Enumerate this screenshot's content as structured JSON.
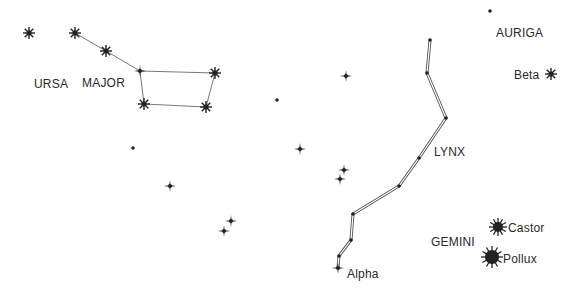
{
  "labels": {
    "ursa": "URSA",
    "major": "MAJOR",
    "auriga": "AURIGA",
    "beta": "Beta",
    "lynx": "LYNX",
    "gemini": "GEMINI",
    "castor": "Castor",
    "pollux": "Pollux",
    "alpha": "Alpha"
  },
  "colors": {
    "ink": "#222222",
    "line": "#555555",
    "background": "#ffffff"
  },
  "constellations": {
    "ursa_major": {
      "stars": [
        [
          29,
          33
        ],
        [
          75,
          33
        ],
        [
          106,
          51
        ],
        [
          140,
          71
        ],
        [
          215,
          73
        ],
        [
          206,
          107
        ],
        [
          144,
          104
        ]
      ],
      "lines": [
        [
          0,
          0
        ],
        [
          1,
          2
        ],
        [
          2,
          3
        ],
        [
          3,
          4
        ],
        [
          4,
          5
        ],
        [
          5,
          6
        ],
        [
          6,
          3
        ]
      ]
    },
    "lynx": {
      "path": [
        [
          430,
          40
        ],
        [
          427,
          73
        ],
        [
          446,
          118
        ],
        [
          419,
          158
        ],
        [
          399,
          186
        ],
        [
          353,
          214
        ],
        [
          351,
          240
        ],
        [
          339,
          256
        ],
        [
          338,
          268
        ]
      ]
    }
  },
  "stars": {
    "eight_point": [
      [
        29,
        33
      ],
      [
        75,
        33
      ],
      [
        106,
        51
      ],
      [
        215,
        73
      ],
      [
        206,
        107
      ],
      [
        144,
        104
      ],
      [
        551,
        74
      ]
    ],
    "four_point": [
      [
        140,
        71
      ],
      [
        346,
        76
      ],
      [
        300,
        149
      ],
      [
        344,
        170
      ],
      [
        340,
        179
      ],
      [
        170,
        186
      ],
      [
        231,
        221
      ],
      [
        224,
        231
      ],
      [
        338,
        268
      ]
    ],
    "dots": [
      [
        133,
        148
      ],
      [
        277,
        100
      ],
      [
        490,
        11
      ],
      [
        430,
        40
      ],
      [
        427,
        73
      ],
      [
        446,
        118
      ],
      [
        419,
        158
      ],
      [
        399,
        186
      ],
      [
        353,
        214
      ],
      [
        351,
        240
      ],
      [
        339,
        256
      ]
    ],
    "bright": [
      {
        "name": "Castor",
        "x": 498,
        "y": 227,
        "r": 6
      },
      {
        "name": "Pollux",
        "x": 492,
        "y": 257,
        "r": 8
      }
    ]
  }
}
